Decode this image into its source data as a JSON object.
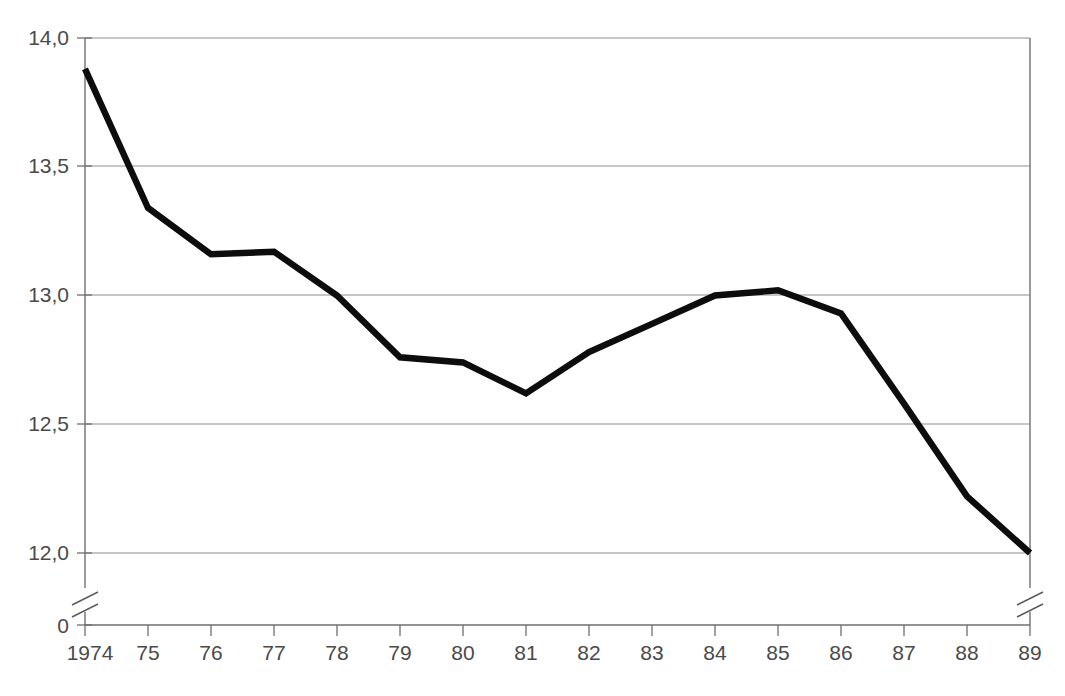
{
  "chart_data": {
    "type": "line",
    "title": "",
    "subtitle": "",
    "xlabel": "",
    "ylabel": "",
    "x": [
      1974,
      1975,
      1976,
      1977,
      1978,
      1979,
      1980,
      1981,
      1982,
      1983,
      1984,
      1985,
      1986,
      1987,
      1988,
      1989
    ],
    "categories": [
      "1974",
      "75",
      "76",
      "77",
      "78",
      "79",
      "80",
      "81",
      "82",
      "83",
      "84",
      "85",
      "86",
      "87",
      "88",
      "89"
    ],
    "values": [
      13.88,
      13.34,
      13.16,
      13.17,
      13.0,
      12.76,
      12.74,
      12.62,
      12.78,
      12.89,
      13.0,
      13.02,
      12.93,
      12.58,
      12.22,
      12.0
    ],
    "series": [
      {
        "name": "series-1",
        "values": [
          13.88,
          13.34,
          13.16,
          13.17,
          13.0,
          12.76,
          12.74,
          12.62,
          12.78,
          12.89,
          13.0,
          13.02,
          12.93,
          12.58,
          12.22,
          12.0
        ],
        "color": "#0d0d0d",
        "line_width": 6.4
      }
    ],
    "ylim": [
      12.0,
      14.0
    ],
    "yticks": [
      12.0,
      12.5,
      13.0,
      13.5,
      14.0
    ],
    "ytick_labels": [
      "12,0",
      "12,5",
      "13,0",
      "13,5",
      "14,0"
    ],
    "y_zero_label": "0",
    "y_axis_break": true,
    "x_axis_break_right": true,
    "grid": "horizontal",
    "legend": "none",
    "decimal_separator": ",",
    "annotations": []
  },
  "axes": {
    "y_labels": [
      "14,0",
      "13,5",
      "13,0",
      "12,5",
      "12,0",
      "0"
    ],
    "x_labels": [
      "1974",
      "75",
      "76",
      "77",
      "78",
      "79",
      "80",
      "81",
      "82",
      "83",
      "84",
      "85",
      "86",
      "87",
      "88",
      "89"
    ]
  },
  "colors": {
    "data_line": "#0d0d0d",
    "gridline": "#8d8d8d",
    "frame": "#6f6f6f",
    "text": "#4a4a4a",
    "background": "#ffffff"
  },
  "captions": {
    "top_cropped": "",
    "bottom_cropped": ""
  }
}
